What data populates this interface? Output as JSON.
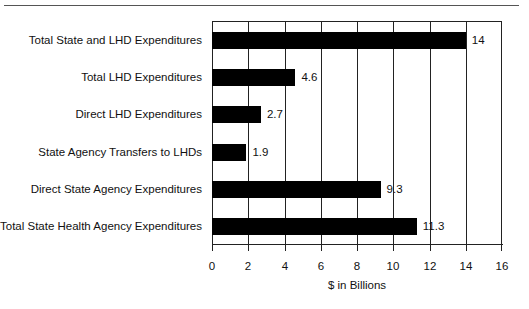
{
  "chart_data": {
    "type": "bar",
    "orientation": "horizontal",
    "title": "",
    "xlabel": "$ in Billions",
    "ylabel": "",
    "xlim": [
      0,
      16
    ],
    "xticks": [
      0,
      2,
      4,
      6,
      8,
      10,
      12,
      14,
      16
    ],
    "grid": "vertical gridlines at each tick",
    "legend": "none",
    "categories": [
      "Total State and LHD Expenditures",
      "Total LHD Expenditures",
      "Direct LHD Expenditures",
      "State Agency Transfers to LHDs",
      "Direct State Agency Expenditures",
      "Total State Health Agency Expenditures"
    ],
    "values": [
      14,
      4.6,
      2.7,
      1.9,
      9.3,
      11.3
    ],
    "value_labels": [
      "14",
      "4.6",
      "2.7",
      "1.9",
      "9.3",
      "11.3"
    ],
    "bar_color": "#000000"
  }
}
